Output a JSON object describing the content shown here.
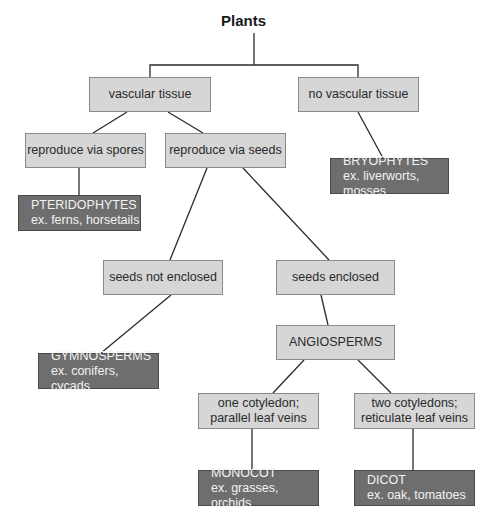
{
  "diagram": {
    "title": "Plants",
    "nodes": {
      "vascular": {
        "lines": [
          "vascular tissue"
        ]
      },
      "no_vascular": {
        "lines": [
          "no vascular tissue"
        ]
      },
      "spores": {
        "lines": [
          "reproduce via spores"
        ]
      },
      "seeds": {
        "lines": [
          "reproduce via seeds"
        ]
      },
      "pteridophytes": {
        "lines": [
          "PTERIDOPHYTES",
          "ex. ferns, horsetails"
        ]
      },
      "bryophytes": {
        "lines": [
          "BRYOPHYTES",
          "ex. liverworts, mosses"
        ]
      },
      "seeds_not_enclosed": {
        "lines": [
          "seeds not enclosed"
        ]
      },
      "seeds_enclosed": {
        "lines": [
          "seeds enclosed"
        ]
      },
      "gymnosperms": {
        "lines": [
          "GYMNOSPERMS",
          "ex. conifers, cycads"
        ]
      },
      "angiosperms": {
        "lines": [
          "ANGIOSPERMS"
        ]
      },
      "one_cotyledon": {
        "lines": [
          "one cotyledon;",
          "parallel leaf veins"
        ]
      },
      "two_cotyledons": {
        "lines": [
          "two cotyledons;",
          "reticulate leaf veins"
        ]
      },
      "monocot": {
        "lines": [
          "MONOCOT",
          "ex. grasses, orchids"
        ]
      },
      "dicot": {
        "lines": [
          "DICOT",
          "ex. oak, tomatoes"
        ]
      }
    },
    "edges": [
      [
        "Plants",
        "vascular tissue"
      ],
      [
        "Plants",
        "no vascular tissue"
      ],
      [
        "vascular tissue",
        "reproduce via spores"
      ],
      [
        "vascular tissue",
        "reproduce via seeds"
      ],
      [
        "no vascular tissue",
        "BRYOPHYTES"
      ],
      [
        "reproduce via spores",
        "PTERIDOPHYTES"
      ],
      [
        "reproduce via seeds",
        "seeds not enclosed"
      ],
      [
        "reproduce via seeds",
        "seeds enclosed"
      ],
      [
        "seeds not enclosed",
        "GYMNOSPERMS"
      ],
      [
        "seeds enclosed",
        "ANGIOSPERMS"
      ],
      [
        "ANGIOSPERMS",
        "one cotyledon; parallel leaf veins"
      ],
      [
        "ANGIOSPERMS",
        "two cotyledons; reticulate leaf veins"
      ],
      [
        "one cotyledon; parallel leaf veins",
        "MONOCOT"
      ],
      [
        "two cotyledons; reticulate leaf veins",
        "DICOT"
      ]
    ],
    "colors": {
      "light_box": "#d6d6d6",
      "dark_box": "#6e6e6e",
      "line": "#2b2b2b"
    }
  }
}
